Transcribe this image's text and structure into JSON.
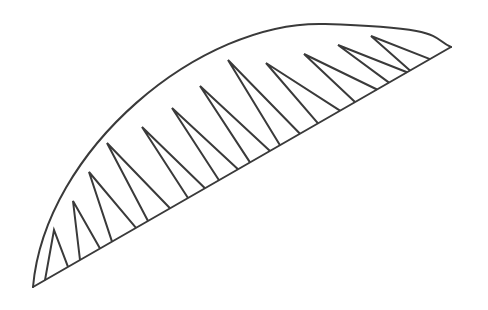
{
  "diagram": {
    "type": "line-drawing",
    "stroke_color": "#3a3a3a",
    "background": "#ffffff",
    "base_line": {
      "x1": 33,
      "y1": 287,
      "x2": 451,
      "y2": 47
    },
    "arc": {
      "start": [
        33,
        287
      ],
      "control": [
        150,
        20
      ],
      "end": [
        451,
        47
      ],
      "apex_approx": [
        325,
        24
      ]
    },
    "spikes": [
      {
        "tip": [
          54,
          230
        ],
        "base_left": 45,
        "base_right": 68
      },
      {
        "tip": [
          73,
          201
        ],
        "base_left": 80,
        "base_right": 100
      },
      {
        "tip": [
          89,
          172
        ],
        "base_left": 112,
        "base_right": 136
      },
      {
        "tip": [
          107,
          143
        ],
        "base_left": 148,
        "base_right": 170
      },
      {
        "tip": [
          142,
          127
        ],
        "base_left": 188,
        "base_right": 205
      },
      {
        "tip": [
          172,
          108
        ],
        "base_left": 219,
        "base_right": 238
      },
      {
        "tip": [
          200,
          86
        ],
        "base_left": 250,
        "base_right": 270
      },
      {
        "tip": [
          228,
          60
        ],
        "base_left": 280,
        "base_right": 300
      },
      {
        "tip": [
          266,
          63
        ],
        "base_left": 318,
        "base_right": 340
      },
      {
        "tip": [
          304,
          54
        ],
        "base_left": 355,
        "base_right": 377
      },
      {
        "tip": [
          338,
          45
        ],
        "base_left": 389,
        "base_right": 407
      },
      {
        "tip": [
          371,
          36
        ],
        "base_left": 410,
        "base_right": 430
      }
    ]
  }
}
